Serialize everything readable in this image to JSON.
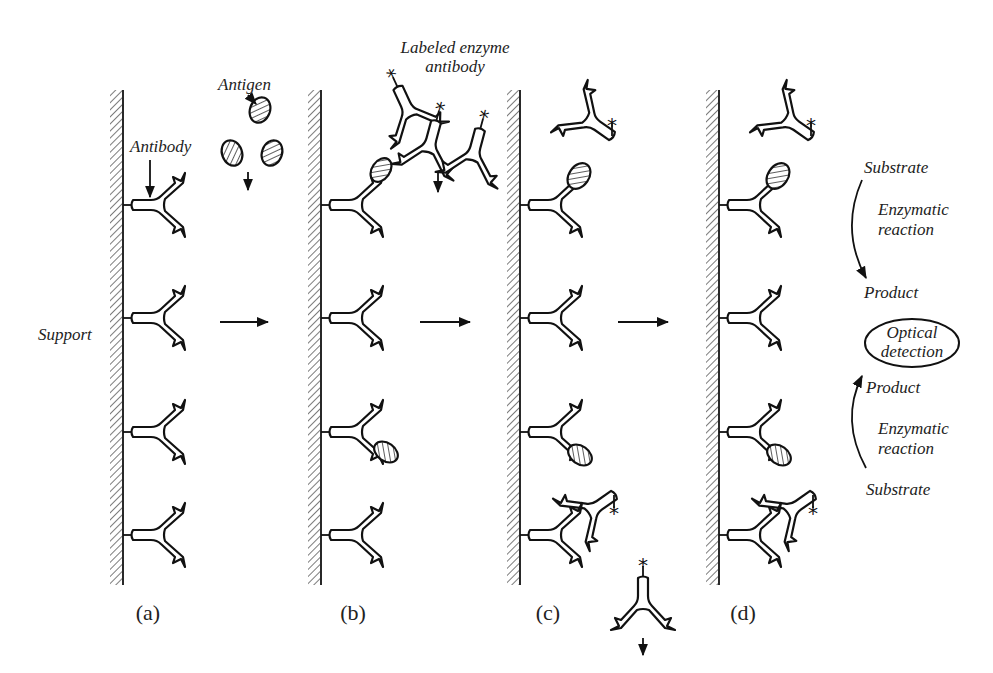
{
  "diagram": {
    "labels": {
      "support": "Support",
      "antibody": "Antibody",
      "antigen": "Antigen",
      "labeled_enzyme_antibody_line1": "Labeled enzyme",
      "labeled_enzyme_antibody_line2": "antibody",
      "substrate_top": "Substrate",
      "enzymatic_top_line1": "Enzymatic",
      "enzymatic_top_line2": "reaction",
      "product_top": "Product",
      "optical_line1": "Optical",
      "optical_line2": "detection",
      "product_bottom": "Product",
      "enzymatic_bottom_line1": "Enzymatic",
      "enzymatic_bottom_line2": "reaction",
      "substrate_bottom": "Substrate"
    },
    "panels": [
      {
        "id": "a",
        "caption": "(a)"
      },
      {
        "id": "b",
        "caption": "(b)"
      },
      {
        "id": "c",
        "caption": "(c)"
      },
      {
        "id": "d",
        "caption": "(d)"
      }
    ],
    "colors": {
      "ink": "#111111",
      "background": "#ffffff"
    }
  }
}
